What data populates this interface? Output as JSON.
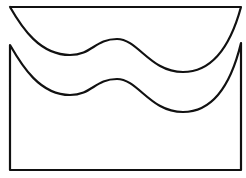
{
  "diagram": {
    "stroke_color": "#111111",
    "background": "#ffffff",
    "stroke_width": 2.2,
    "shapes": [
      {
        "name": "upper-wave-shape",
        "path": "M10,7 L241,7 C232,40 215,72 183,72 C150,72 138,39 117,39 C95,39 92,55 70,55 C40,55 22,28 10,7"
      },
      {
        "name": "lower-wave-box",
        "path": "M10,45 C22,66 40,95 70,95 C92,95 95,79 117,79 C138,79 150,112 183,112 C215,112 232,80 241,43 L241,170 L10,170 Z"
      }
    ]
  }
}
